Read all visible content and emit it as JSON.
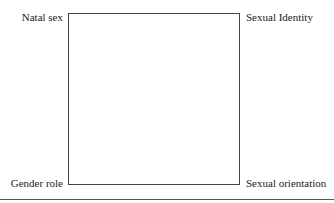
{
  "diagram": {
    "corners": {
      "top_left": "Natal sex",
      "top_right": "Sexual Identity",
      "bottom_left": "Gender role",
      "bottom_right": "Sexual orientation"
    }
  }
}
